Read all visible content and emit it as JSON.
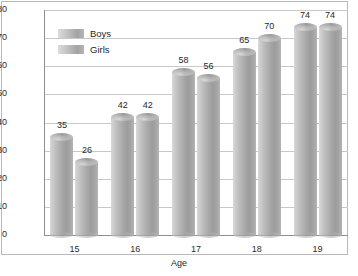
{
  "chart_data": {
    "type": "bar",
    "title": "",
    "xlabel": "Age",
    "ylabel": "Percentage",
    "categories": [
      "15",
      "16",
      "17",
      "18",
      "19"
    ],
    "series": [
      {
        "name": "Boys",
        "values": [
          35,
          42,
          58,
          65,
          74
        ]
      },
      {
        "name": "Girls",
        "values": [
          26,
          42,
          56,
          70,
          74
        ]
      }
    ],
    "ylim": [
      0,
      80
    ],
    "ytick_step": 10,
    "yticks": [
      "80",
      "70",
      "60",
      "50",
      "40",
      "30",
      "20",
      "10",
      "0"
    ],
    "grid": true,
    "legend_position": "top-left-inside",
    "data_labels": true,
    "style": "3d-cylinder-grayscale"
  },
  "legend": {
    "items": [
      {
        "label": "Boys",
        "color": "#b0b0b0"
      },
      {
        "label": "Girls",
        "color": "#a8a8a8"
      }
    ]
  },
  "colors": {
    "bar_light": "#d8d8d8",
    "bar_dark": "#9c9c9c",
    "gridline": "#c8c8c8",
    "axis": "#8f8f8f",
    "text": "#1f1f1f",
    "background": "#ffffff",
    "border": "#b9b9b9"
  }
}
